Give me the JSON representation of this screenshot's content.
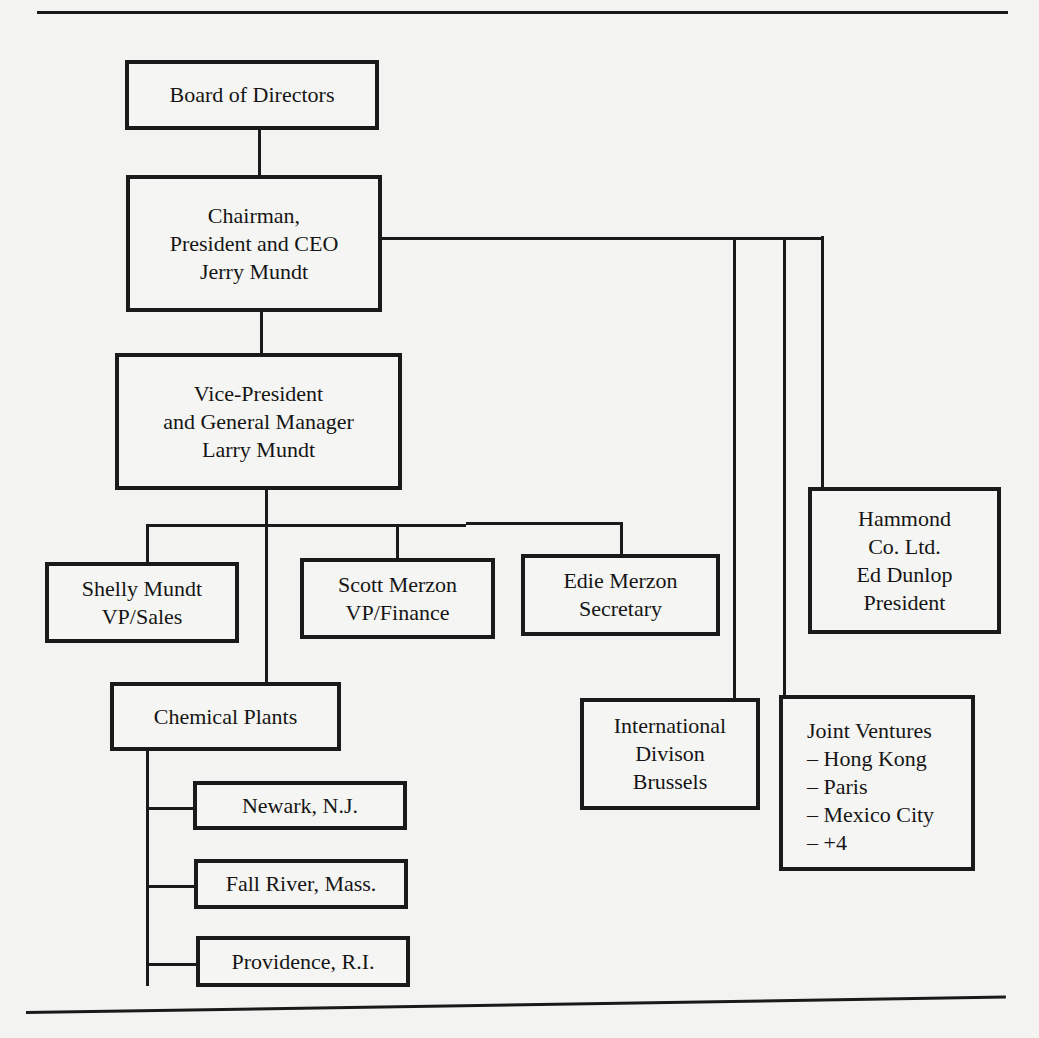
{
  "org_chart": {
    "board": {
      "label": "Board of Directors"
    },
    "ceo": {
      "label": "Chairman,\nPresident and CEO\nJerry Mundt"
    },
    "vp_gm": {
      "label": "Vice-President\nand General Manager\nLarry Mundt"
    },
    "reports": [
      {
        "label": "Shelly Mundt\nVP/Sales"
      },
      {
        "label": "Scott Merzon\nVP/Finance"
      },
      {
        "label": "Edie Merzon\nSecretary"
      }
    ],
    "chemical_plants": {
      "label": "Chemical Plants",
      "plants": [
        {
          "label": "Newark, N.J."
        },
        {
          "label": "Fall River, Mass."
        },
        {
          "label": "Providence, R.I."
        }
      ]
    },
    "international": {
      "label": "International\nDivison\nBrussels"
    },
    "joint_ventures": {
      "label": "Joint Ventures\n– Hong Kong\n– Paris\n– Mexico City\n– +4"
    },
    "hammond": {
      "label": "Hammond\nCo. Ltd.\nEd Dunlop\nPresident"
    }
  }
}
